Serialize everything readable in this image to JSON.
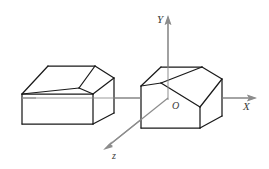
{
  "figure": {
    "background_color": "#ffffff",
    "edge_color": "#1a1a1a",
    "axis_color": "#8c8c8c",
    "label_color": "#3a3a3a",
    "width": 269,
    "height": 169
  },
  "axes": {
    "origin_label": "O",
    "x_label": "X",
    "y_label": "Y",
    "z_label": "z",
    "origin_point": {
      "x": 168,
      "y": 98
    },
    "x_axis": {
      "from": {
        "x": 36,
        "y": 98
      },
      "to": {
        "x": 256,
        "y": 98
      },
      "arrow_at": "end"
    },
    "y_axis": {
      "from": {
        "x": 168,
        "y": 100
      },
      "to": {
        "x": 168,
        "y": 16
      },
      "arrow_at": "end"
    },
    "z_axis": {
      "from": {
        "x": 168,
        "y": 98
      },
      "to": {
        "x": 104,
        "y": 149
      },
      "arrow_at": "end"
    },
    "x_label_pos": {
      "x": 245,
      "y": 108
    },
    "y_label_pos": {
      "x": 157,
      "y": 22
    },
    "z_label_pos": {
      "x": 111,
      "y": 157
    },
    "origin_label_pos": {
      "x": 172,
      "y": 108
    }
  },
  "solids": [
    {
      "name": "left-solid",
      "description": "Rectangular block with a long chamfer cut along the upper-left edge",
      "outline": "22,94 22,124 93,132 114,113 114,78 95,66 48,66",
      "edges": [
        {
          "name": "top-front-left-slant",
          "points": "22,94 48,66"
        },
        {
          "name": "top-ridge",
          "points": "48,66 95,66"
        },
        {
          "name": "chamfer-fold",
          "points": "22,94 79,88"
        },
        {
          "name": "chamfer-inner-right",
          "points": "79,88 95,66"
        },
        {
          "name": "top-face-right",
          "points": "95,66 114,78"
        },
        {
          "name": "chamfer-to-corner",
          "points": "79,88 98,99"
        },
        {
          "name": "front-top",
          "points": "22,94 93,94"
        },
        {
          "name": "right-upper",
          "points": "93,94 114,78"
        },
        {
          "name": "front-left-vertical",
          "points": "22,94 22,124"
        },
        {
          "name": "front-bottom",
          "points": "22,124 93,124"
        },
        {
          "name": "front-right-vertical",
          "points": "93,94 93,124"
        },
        {
          "name": "bottom-right-slant",
          "points": "93,124 114,113"
        },
        {
          "name": "right-vertical",
          "points": "114,78 114,113"
        }
      ]
    },
    {
      "name": "right-solid",
      "description": "Rectangular block with a broad slanted chamfer across the top running toward the lower right",
      "edges": [
        {
          "name": "top-left-slant",
          "points": "141,86 161,67"
        },
        {
          "name": "top-ridge",
          "points": "161,67 202,67"
        },
        {
          "name": "top-face-right-slant",
          "points": "202,67 222,79"
        },
        {
          "name": "chamfer-upper-fold",
          "points": "161,83 202,67"
        },
        {
          "name": "chamfer-left-edge",
          "points": "141,86 161,83"
        },
        {
          "name": "chamfer-lower-fold",
          "points": "161,83 200,107"
        },
        {
          "name": "chamfer-right-edge",
          "points": "200,107 222,79"
        },
        {
          "name": "front-top-left",
          "points": "141,86 141,128"
        },
        {
          "name": "front-bottom",
          "points": "141,128 200,128"
        },
        {
          "name": "front-vertical-mid",
          "points": "200,107 200,128"
        },
        {
          "name": "bottom-right-slant",
          "points": "200,128 222,116"
        },
        {
          "name": "right-vertical",
          "points": "222,79 222,116"
        },
        {
          "name": "hidden-top-left-corner",
          "points": "141,86 161,83"
        }
      ]
    }
  ]
}
